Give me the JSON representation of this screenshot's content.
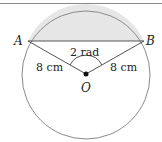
{
  "diagram": {
    "type": "circle-segment",
    "points": {
      "A": {
        "label": "A"
      },
      "B": {
        "label": "B"
      },
      "O": {
        "label": "O"
      }
    },
    "angle_label": "2 rad",
    "radius_left_label": "8 cm",
    "radius_right_label": "8 cm",
    "colors": {
      "circle": "#8a8a8a",
      "lines": "#555555",
      "segment_fill": "#e6e6e6",
      "center_dot": "#111111"
    }
  }
}
